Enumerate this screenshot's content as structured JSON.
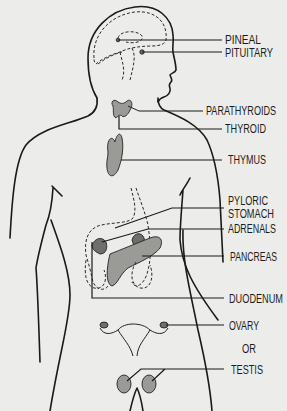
{
  "diagram": {
    "title": "",
    "labels": {
      "pineal": "PINEAL",
      "pituitary": "PITUITARY",
      "parathyroids": "PARATHYROIDS",
      "thyroid": "THYROID",
      "thymus": "THYMUS",
      "pyloric": "PYLORIC",
      "stomach": "STOMACH",
      "adrenals": "ADRENALS",
      "pancreas": "PANCREAS",
      "duodenum": "DUODENUM",
      "ovary": "OVARY",
      "or": "OR",
      "testis": "TESTIS"
    },
    "colors": {
      "background": "#ececea",
      "ink": "#1a1a1a",
      "gland_fill": "#9a9a96"
    }
  }
}
